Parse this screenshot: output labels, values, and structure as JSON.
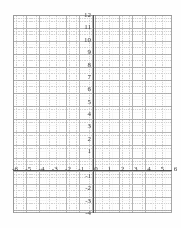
{
  "document": {
    "kind": "coordinate-grid-worksheet",
    "background_color": "#ffffff"
  },
  "chart_data": {
    "type": "scatter",
    "title": "",
    "subtitle": "",
    "xlabel": "",
    "ylabel": "",
    "xlim": [
      -6,
      6
    ],
    "ylim": [
      -4,
      12
    ],
    "grid": true,
    "minor_grid": true,
    "minor_ticks_per_unit": 4,
    "legend": null,
    "series": [],
    "x_tick_labels": [
      "-6",
      "-5",
      "-4",
      "-3",
      "-2",
      "-1",
      "0",
      "1",
      "2",
      "3",
      "4",
      "5",
      "6"
    ],
    "x_tick_values": [
      -6,
      -5,
      -4,
      -3,
      -2,
      -1,
      0,
      1,
      2,
      3,
      4,
      5,
      6
    ],
    "y_tick_labels": [
      "12",
      "11",
      "10",
      "9",
      "8",
      "7",
      "6",
      "5",
      "4",
      "3",
      "2",
      "1",
      "-1",
      "-2",
      "-3",
      "-4"
    ],
    "y_tick_values": [
      12,
      11,
      10,
      9,
      8,
      7,
      6,
      5,
      4,
      3,
      2,
      1,
      -1,
      -2,
      -3,
      -4
    ],
    "colors": {
      "axis": "#4a4a4a",
      "major_grid": "#9a9a9a",
      "minor_grid": "#a9a9a9",
      "tick_label": "#3a3a3a",
      "frame": "#8e8e8e"
    }
  }
}
